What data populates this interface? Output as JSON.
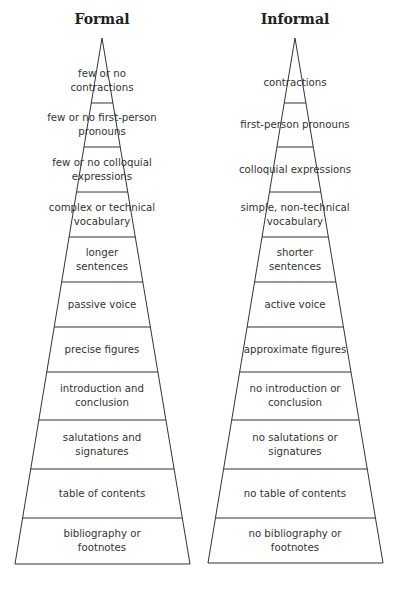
{
  "pyramids": [
    {
      "title": "Formal",
      "levels": [
        "few or no\ncontractions",
        "few or no first-person\npronouns",
        "few or no colloquial\nexpressions",
        "complex or technical\nvocabulary",
        "longer\nsentences",
        "passive voice",
        "precise figures",
        "introduction and\nconclusion",
        "salutations and\nsignatures",
        "table of contents",
        "bibliography or\nfootnotes"
      ]
    },
    {
      "title": "Informal",
      "levels": [
        "contractions",
        "first-person pronouns",
        "colloquial expressions",
        "simple, non-technical\nvocabulary",
        "shorter\nsentences",
        "active voice",
        "approximate figures",
        "no introduction or\nconclusion",
        "no salutations or\nsignatures",
        "no table of contents",
        "no bibliography or\nfootnotes"
      ]
    }
  ],
  "colors": {
    "line": "#333333",
    "text": "#333333",
    "background": "#ffffff"
  }
}
